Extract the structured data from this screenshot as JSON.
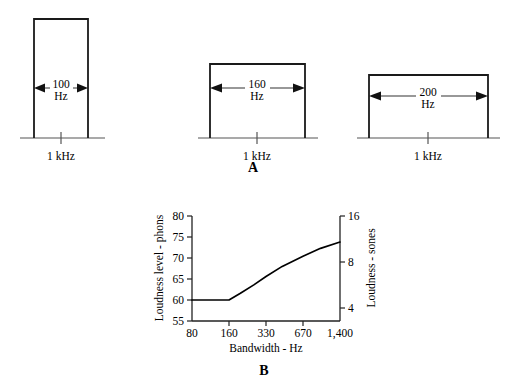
{
  "figure": {
    "panel_a": {
      "letter": "A",
      "bands": [
        {
          "name": "band-100hz",
          "width_label": "100",
          "unit_label": "Hz",
          "center_label": "1 kHz",
          "bandwidth_hz": 100,
          "rect": {
            "x": 34,
            "y": 19,
            "w": 54,
            "h": 119
          },
          "baseline": {
            "x1": 20,
            "x2": 105,
            "y": 138
          },
          "center_tick_x": 61,
          "arrow_y": 88,
          "text_x": 61,
          "text_y": 85
        },
        {
          "name": "band-160hz",
          "width_label": "160",
          "unit_label": "Hz",
          "center_label": "1 kHz",
          "bandwidth_hz": 160,
          "rect": {
            "x": 210,
            "y": 64,
            "w": 95,
            "h": 74
          },
          "baseline": {
            "x1": 198,
            "x2": 318,
            "y": 138
          },
          "center_tick_x": 257,
          "arrow_y": 88,
          "text_x": 257,
          "text_y": 85
        },
        {
          "name": "band-200hz",
          "width_label": "200",
          "unit_label": "Hz",
          "center_label": "1 kHz",
          "bandwidth_hz": 200,
          "rect": {
            "x": 369,
            "y": 75,
            "w": 119,
            "h": 63
          },
          "baseline": {
            "x1": 357,
            "x2": 500,
            "y": 138
          },
          "center_tick_x": 428,
          "arrow_y": 96,
          "text_x": 428,
          "text_y": 93
        }
      ]
    },
    "panel_b": {
      "letter": "B"
    }
  },
  "chart_data": {
    "type": "line",
    "title": "",
    "xlabel": "Bandwidth - Hz",
    "ylabel": "Loudness level - phons",
    "y2label": "Loudness - sones",
    "xscale": "log-banded",
    "x_tick_labels": [
      "80",
      "160",
      "330",
      "670",
      "1,400"
    ],
    "x_tick_values": [
      80,
      160,
      330,
      670,
      1400
    ],
    "y_tick_labels": [
      "55",
      "60",
      "65",
      "70",
      "75",
      "80"
    ],
    "y_tick_values": [
      55,
      60,
      65,
      70,
      75,
      80
    ],
    "ylim": [
      55,
      80
    ],
    "y2_tick_labels": [
      "4",
      "8",
      "16"
    ],
    "y2_tick_values": [
      4,
      8,
      16
    ],
    "y2lim": [
      2,
      16
    ],
    "grid": false,
    "legend": "none",
    "series": [
      {
        "name": "loudness-level",
        "points": [
          {
            "x": 80,
            "y": 60.0
          },
          {
            "x": 110,
            "y": 60.0
          },
          {
            "x": 160,
            "y": 60.0
          },
          {
            "x": 200,
            "y": 61.6
          },
          {
            "x": 260,
            "y": 63.6
          },
          {
            "x": 330,
            "y": 65.6
          },
          {
            "x": 450,
            "y": 68.0
          },
          {
            "x": 670,
            "y": 70.4
          },
          {
            "x": 950,
            "y": 72.3
          },
          {
            "x": 1400,
            "y": 73.8
          }
        ]
      }
    ]
  }
}
